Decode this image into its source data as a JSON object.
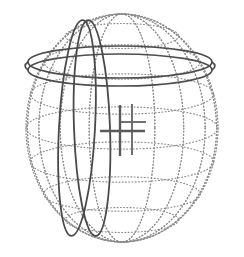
{
  "figure": {
    "background_color": "#ffffff",
    "width": 244,
    "height": 257
  },
  "chart_data": {
    "type": "scatter",
    "subtitle": "",
    "xlabel": "",
    "ylabel": "",
    "grid": "on",
    "legend_position": "none",
    "annotations": [],
    "sphere": {
      "label": "globe-wireframe",
      "center_x": 122,
      "center_y": 128,
      "radius_x": 96,
      "radius_y": 114,
      "stroke_color": "#8c8c8c",
      "line_style": "dotted",
      "latitude_count": 7,
      "longitude_count": 9,
      "latitude_offsets": [
        -92,
        -66,
        -34,
        0,
        34,
        66,
        92
      ],
      "longitude_phases": [
        -80,
        -60,
        -40,
        -20,
        0,
        20,
        40,
        60,
        80
      ]
    },
    "rings": [
      {
        "name": "equatorial-band-outer",
        "type": "horizontal-ellipse",
        "center_x": 120,
        "center_y": 62,
        "radius_x": 92,
        "radius_y": 16,
        "stroke_color": "#4d4d4d",
        "stroke_width": 1.7
      },
      {
        "name": "equatorial-band-inner",
        "type": "horizontal-ellipse",
        "center_x": 120,
        "center_y": 70,
        "radius_x": 92,
        "radius_y": 16,
        "stroke_color": "#4d4d4d",
        "stroke_width": 1.7
      }
    ],
    "orbits": [
      {
        "name": "polar-orbit-left",
        "type": "vertical-ellipse",
        "center_x": 77,
        "center_y": 128,
        "radius_x": 18,
        "radius_y": 108,
        "rotation_deg": 3,
        "stroke_color": "#4a4a4a",
        "stroke_width": 1.8
      },
      {
        "name": "polar-orbit-right",
        "type": "vertical-ellipse",
        "center_x": 92,
        "center_y": 128,
        "radius_x": 18,
        "radius_y": 108,
        "rotation_deg": -2,
        "stroke_color": "#4a4a4a",
        "stroke_width": 1.8
      }
    ],
    "markers": [
      {
        "name": "cross-marker-large",
        "type": "plus",
        "x": 120,
        "y": 131,
        "arm_left": 20,
        "arm_right": 25,
        "arm_up": 26,
        "arm_down": 25,
        "stroke_color": "#5a5a5a",
        "stroke_width": 2.4
      },
      {
        "name": "cross-marker-small",
        "type": "plus",
        "x": 132,
        "y": 122,
        "arm_left": 12,
        "arm_right": 14,
        "arm_up": 18,
        "arm_down": 33,
        "stroke_color": "#6a6a6a",
        "stroke_width": 1.9
      }
    ],
    "colors": {
      "grid": "#8c8c8c",
      "ring": "#4d4d4d",
      "orbit": "#4a4a4a",
      "marker": "#5a5a5a",
      "background": "#ffffff"
    }
  }
}
